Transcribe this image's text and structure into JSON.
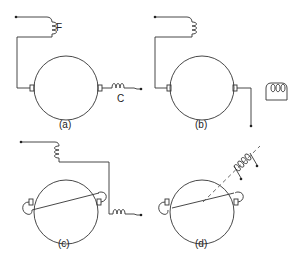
{
  "figure": {
    "panels": [
      {
        "id": "a",
        "label": "(a)",
        "coil_labels": {
          "field": "F",
          "compensating": "C"
        }
      },
      {
        "id": "b",
        "label": "(b)"
      },
      {
        "id": "c",
        "label": "(c)"
      },
      {
        "id": "d",
        "label": "(d)"
      }
    ]
  }
}
